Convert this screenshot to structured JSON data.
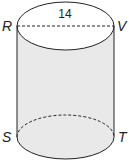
{
  "figure": {
    "type": "cylinder",
    "dimension_label": "14",
    "points": {
      "top_left": "R",
      "top_right": "V",
      "bottom_left": "S",
      "bottom_right": "T"
    },
    "colors": {
      "fill": "#e9e9e9",
      "stroke": "#222222"
    }
  }
}
